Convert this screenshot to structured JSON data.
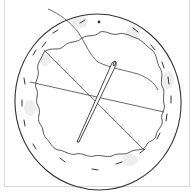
{
  "illustration": {
    "subject": "fabric circle with running stitch, threads and needle",
    "colors": {
      "line": "#333333",
      "shade": "#e6e6e6",
      "frame": "#d8d8d8",
      "background": "#ffffff"
    },
    "elements": [
      "outer-circle",
      "wavy-inner-edge",
      "stitch-dashes",
      "thread-lines",
      "needle",
      "dot"
    ]
  }
}
